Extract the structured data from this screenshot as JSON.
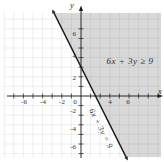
{
  "figure": {
    "axis_labels": {
      "x": "x",
      "y": "y"
    },
    "inequality_label": "6x + 3y ≥ 9",
    "line_label": "6x + 3y = 9",
    "x_tick_labels": [
      {
        "label": "-6",
        "px": 24
      },
      {
        "label": "-4",
        "px": 43
      },
      {
        "label": "-2",
        "px": 62
      },
      {
        "label": "0",
        "px": 75
      },
      {
        "label": "4",
        "px": 110
      },
      {
        "label": "6",
        "px": 128
      }
    ],
    "y_tick_labels": [
      {
        "label": "6",
        "py": 34
      },
      {
        "label": "4",
        "py": 56
      },
      {
        "label": "2",
        "py": 78
      },
      {
        "label": "-2",
        "py": 111
      },
      {
        "label": "-4",
        "py": 129
      },
      {
        "label": "-6",
        "py": 147
      }
    ],
    "colors": {
      "shading": "#d8d8d8",
      "boundary_line": "#1a1a1a",
      "grid": "#dadada",
      "axis": "#1a1a1a",
      "text": "#2e2e2e"
    }
  },
  "chart_data": {
    "type": "line",
    "title": "",
    "inequality": "6x + 3y ≥ 9",
    "boundary_equation": "6x + 3y = 9",
    "line": {
      "slope": -2,
      "y_intercept": 3,
      "x_intercept": 1.5,
      "points": [
        [
          0,
          3
        ],
        [
          1.5,
          0
        ]
      ],
      "style": "solid with arrowheads at both ends"
    },
    "shaded_region": "closed half-plane above/right of the line (6x + 3y >= 9)",
    "xlabel": "x",
    "ylabel": "y",
    "xlim": [
      -7,
      7
    ],
    "ylim": [
      -7,
      7
    ],
    "tick_step": 1,
    "grid": true,
    "x_axis_labeled_ticks": [
      -6,
      -4,
      -2,
      0,
      4,
      6
    ],
    "y_axis_labeled_ticks": [
      6,
      4,
      2,
      -2,
      -4,
      -6
    ]
  }
}
